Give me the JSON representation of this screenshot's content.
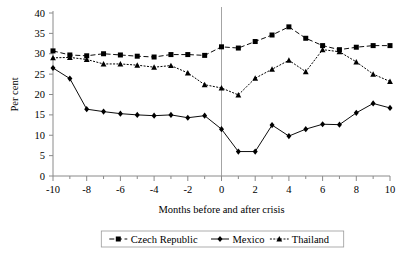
{
  "chart_data": {
    "type": "line",
    "title": "",
    "xlabel": "Months before and after crisis",
    "ylabel": "Per cent",
    "xlim": [
      -10,
      10
    ],
    "ylim": [
      0,
      40
    ],
    "yticks": [
      0,
      5,
      10,
      15,
      20,
      25,
      30,
      35,
      40
    ],
    "xticks": [
      -10,
      -8,
      -6,
      -4,
      -2,
      0,
      2,
      4,
      6,
      8,
      10
    ],
    "xtick_labels": [
      "-10",
      "-8",
      "-6",
      "-4",
      "-2",
      "0",
      "2",
      "4",
      "6",
      "8",
      "10"
    ],
    "ytick_labels": [
      "0",
      "5",
      "10",
      "15",
      "20",
      "25",
      "30",
      "35",
      "40"
    ],
    "xtick_minor_step": 1,
    "grid": false,
    "vertical_reference_line_x": 0,
    "legend_position": "bottom",
    "x": [
      -10,
      -9,
      -8,
      -7,
      -6,
      -5,
      -4,
      -3,
      -2,
      -1,
      0,
      1,
      2,
      3,
      4,
      5,
      6,
      7,
      8,
      9,
      10
    ],
    "series": [
      {
        "name": "Czech Republic",
        "marker": "square",
        "line_style": "dashed",
        "color": "#000000",
        "values": [
          30.7,
          29.7,
          29.5,
          30.0,
          29.7,
          29.4,
          29.2,
          29.8,
          29.8,
          29.6,
          31.7,
          31.4,
          33.0,
          34.6,
          36.6,
          33.8,
          32.0,
          31.0,
          31.6,
          32.0,
          32.0
        ]
      },
      {
        "name": "Mexico",
        "marker": "diamond",
        "line_style": "solid",
        "color": "#000000",
        "values": [
          26.5,
          23.9,
          16.4,
          15.8,
          15.3,
          15.0,
          14.8,
          15.0,
          14.3,
          14.8,
          11.5,
          6.0,
          6.0,
          12.5,
          9.8,
          11.5,
          12.7,
          12.6,
          15.5,
          17.8,
          16.7
        ]
      },
      {
        "name": "Thailand",
        "marker": "triangle",
        "line_style": "dotted",
        "color": "#000000",
        "values": [
          29.0,
          29.1,
          28.6,
          27.5,
          27.5,
          27.2,
          26.7,
          27.1,
          25.3,
          22.4,
          21.6,
          19.9,
          24.0,
          26.2,
          28.4,
          25.6,
          31.0,
          30.5,
          28.0,
          25.0,
          23.2
        ]
      }
    ]
  },
  "legend": {
    "items": [
      {
        "label": "Czech Republic",
        "marker": "square",
        "style": "dashed"
      },
      {
        "label": "Mexico",
        "marker": "diamond",
        "style": "solid"
      },
      {
        "label": "Thailand",
        "marker": "triangle",
        "style": "dotted"
      }
    ]
  },
  "source_note": ""
}
